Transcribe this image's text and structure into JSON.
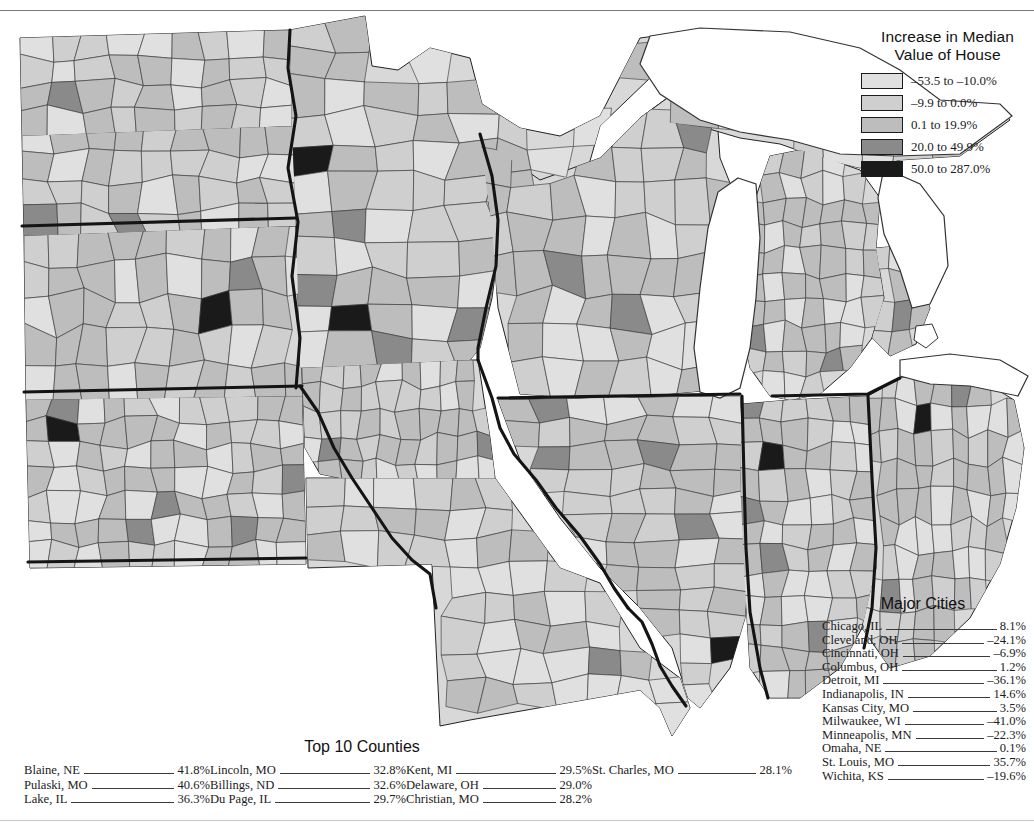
{
  "map": {
    "title_visible": false,
    "region": "US Midwest counties choropleth",
    "background_color": "#ffffff"
  },
  "legend": {
    "title_line1": "Increase in Median",
    "title_line2": "Value of House",
    "classes": [
      {
        "label": "–53.5 to –10.0%",
        "color": "#e0e0e0"
      },
      {
        "label": "–9.9 to 0.0%",
        "color": "#cfcfcf"
      },
      {
        "label": "0.1 to 19.9%",
        "color": "#bdbdbd"
      },
      {
        "label": "20.0 to 49.9%",
        "color": "#8a8a8a"
      },
      {
        "label": "50.0 to 287.0%",
        "color": "#1a1a1a"
      }
    ]
  },
  "major_cities": {
    "title": "Major Cities",
    "rows": [
      {
        "name": "Chicago, IL",
        "value": "8.1%"
      },
      {
        "name": "Cleveland, OH",
        "value": "–24.1%"
      },
      {
        "name": "Cincinnati, OH",
        "value": "–6.9%"
      },
      {
        "name": "Columbus, OH",
        "value": "1.2%"
      },
      {
        "name": "Detroit, MI",
        "value": "–36.1%"
      },
      {
        "name": "Indianapolis, IN",
        "value": "14.6%"
      },
      {
        "name": "Kansas City, MO",
        "value": "3.5%"
      },
      {
        "name": "Milwaukee, WI",
        "value": "–41.0%"
      },
      {
        "name": "Minneapolis, MN",
        "value": "–22.3%"
      },
      {
        "name": "Omaha, NE",
        "value": "0.1%"
      },
      {
        "name": "St. Louis, MO",
        "value": "35.7%"
      },
      {
        "name": "Wichita, KS",
        "value": "–19.6%"
      }
    ]
  },
  "top_counties": {
    "title": "Top 10 Counties",
    "columns": [
      [
        {
          "name": "Blaine, NE",
          "value": "41.8%"
        },
        {
          "name": "Pulaski, MO",
          "value": "40.6%"
        },
        {
          "name": "Lake, IL",
          "value": "36.3%"
        }
      ],
      [
        {
          "name": "Lincoln, MO",
          "value": "32.8%"
        },
        {
          "name": "Billings, ND",
          "value": "32.6%"
        },
        {
          "name": "Du Page, IL",
          "value": "29.7%"
        }
      ],
      [
        {
          "name": "Kent, MI",
          "value": "29.5%"
        },
        {
          "name": "Delaware, OH",
          "value": "29.0%"
        },
        {
          "name": "Christian, MO",
          "value": "28.2%"
        }
      ],
      [
        {
          "name": "St. Charles, MO",
          "value": "28.1%"
        }
      ]
    ]
  },
  "chart_data": {
    "type": "map",
    "map_type": "choropleth",
    "title": "Increase in Median Value of House",
    "unit": "percent change",
    "geography": "counties",
    "region": "US Midwest (ND, SD, NE, KS, MN, IA, MO, WI, IL, MI, IN, OH)",
    "class_breaks": [
      {
        "range": "–53.5 to –10.0%",
        "min": -53.5,
        "max": -10.0,
        "color": "#e0e0e0"
      },
      {
        "range": "–9.9 to 0.0%",
        "min": -9.9,
        "max": 0.0,
        "color": "#cfcfcf"
      },
      {
        "range": "0.1 to 19.9%",
        "min": 0.1,
        "max": 19.9,
        "color": "#bdbdbd"
      },
      {
        "range": "20.0 to 49.9%",
        "min": 20.0,
        "max": 49.9,
        "color": "#8a8a8a"
      },
      {
        "range": "50.0 to 287.0%",
        "min": 50.0,
        "max": 287.0,
        "color": "#1a1a1a"
      }
    ],
    "annotated_values": {
      "major_cities": [
        {
          "name": "Chicago, IL",
          "value": 8.1
        },
        {
          "name": "Cleveland, OH",
          "value": -24.1
        },
        {
          "name": "Cincinnati, OH",
          "value": -6.9
        },
        {
          "name": "Columbus, OH",
          "value": 1.2
        },
        {
          "name": "Detroit, MI",
          "value": -36.1
        },
        {
          "name": "Indianapolis, IN",
          "value": 14.6
        },
        {
          "name": "Kansas City, MO",
          "value": 3.5
        },
        {
          "name": "Milwaukee, WI",
          "value": -41.0
        },
        {
          "name": "Minneapolis, MN",
          "value": -22.3
        },
        {
          "name": "Omaha, NE",
          "value": 0.1
        },
        {
          "name": "St. Louis, MO",
          "value": 35.7
        },
        {
          "name": "Wichita, KS",
          "value": -19.6
        }
      ],
      "top_10_counties": [
        {
          "name": "Blaine, NE",
          "value": 41.8
        },
        {
          "name": "Pulaski, MO",
          "value": 40.6
        },
        {
          "name": "Lake, IL",
          "value": 36.3
        },
        {
          "name": "Lincoln, MO",
          "value": 32.8
        },
        {
          "name": "Billings, ND",
          "value": 32.6
        },
        {
          "name": "Du Page, IL",
          "value": 29.7
        },
        {
          "name": "Kent, MI",
          "value": 29.5
        },
        {
          "name": "Delaware, OH",
          "value": 29.0
        },
        {
          "name": "Christian, MO",
          "value": 28.2
        },
        {
          "name": "St. Charles, MO",
          "value": 28.1
        }
      ]
    },
    "legend_position": "top-right",
    "grid": false
  }
}
